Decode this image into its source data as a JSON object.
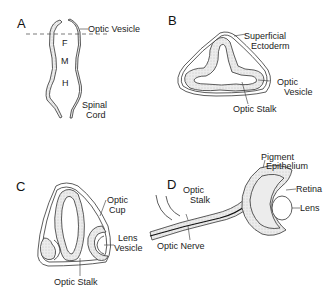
{
  "figure": {
    "panels": [
      {
        "id": "A",
        "letter": "A",
        "regions": [
          "F",
          "M",
          "H"
        ],
        "labels": [
          "Optic Vesicle",
          "Spinal",
          "Cord"
        ]
      },
      {
        "id": "B",
        "letter": "B",
        "labels": [
          "Superficial",
          "Ectoderm",
          "Optic",
          "Vesicle",
          "Optic Stalk"
        ]
      },
      {
        "id": "C",
        "letter": "C",
        "labels": [
          "Optic",
          "Cup",
          "Lens",
          "Vesicle",
          "Optic Stalk"
        ]
      },
      {
        "id": "D",
        "letter": "D",
        "labels": [
          "Pigment",
          "Epithelium",
          "Retina",
          "Lens",
          "Optic",
          "Stalk",
          "Optic Nerve"
        ]
      }
    ],
    "colors": {
      "line": "#333333",
      "fill": "#e6e6e6",
      "background": "#ffffff"
    }
  }
}
